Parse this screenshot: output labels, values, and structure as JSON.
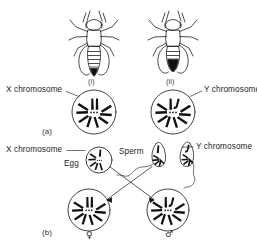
{
  "figure": {
    "title_fragment": "",
    "panels": [
      {
        "id": "a",
        "label": "(a)"
      },
      {
        "id": "b",
        "label": "(b)"
      }
    ]
  },
  "panel_a": {
    "flies": [
      {
        "id": "i",
        "label": "(i)",
        "sex": "female"
      },
      {
        "id": "ii",
        "label": "(ii)",
        "sex": "male"
      }
    ],
    "labels": {
      "x_chromosome": "X chromosome",
      "y_chromosome": "Y chromosome"
    },
    "cells": [
      {
        "id": "female-cell",
        "chromosomes": "XX"
      },
      {
        "id": "male-cell",
        "chromosomes": "XY"
      }
    ]
  },
  "panel_b": {
    "labels": {
      "x_chromosome": "X chromosome",
      "y_chromosome": "Y chromosome",
      "egg": "Egg",
      "sperm": "Sperm"
    },
    "gametes": [
      {
        "id": "egg",
        "type": "egg",
        "chromosome": "X"
      },
      {
        "id": "sperm-x",
        "type": "sperm",
        "chromosome": "X"
      },
      {
        "id": "sperm-y",
        "type": "sperm",
        "chromosome": "Y"
      }
    ],
    "offspring": [
      {
        "id": "daughter",
        "symbol": "♀",
        "chromosomes": "XX"
      },
      {
        "id": "son",
        "symbol": "♂",
        "chromosomes": "XY"
      }
    ]
  }
}
